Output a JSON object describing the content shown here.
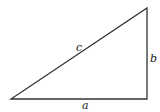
{
  "diagram": {
    "type": "right-triangle",
    "vertices": {
      "bottom_left": [
        11,
        99
      ],
      "bottom_right": [
        147,
        99
      ],
      "top_right": [
        147,
        8
      ]
    },
    "stroke_color": "#333333",
    "labels": {
      "hypotenuse": "c",
      "vertical_leg": "b",
      "horizontal_leg": "a"
    }
  }
}
